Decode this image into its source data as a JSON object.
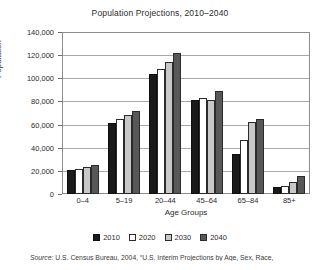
{
  "chart_data": {
    "type": "bar",
    "title": "Population Projections, 2010–2040",
    "xlabel": "Age Groups",
    "ylabel": "Population",
    "categories": [
      "0–4",
      "5–19",
      "20–44",
      "45–64",
      "65–84",
      "85+"
    ],
    "series": [
      {
        "name": "2010",
        "color": "#1a1a1a",
        "values": [
          21000,
          61000,
          104000,
          81000,
          35000,
          6000
        ]
      },
      {
        "name": "2020",
        "color": "#ffffff",
        "values": [
          22000,
          65000,
          108000,
          83000,
          47000,
          7000
        ]
      },
      {
        "name": "2030",
        "color": "#c8c8c8",
        "values": [
          23000,
          68000,
          114000,
          81000,
          62000,
          10000
        ]
      },
      {
        "name": "2040",
        "color": "#585858",
        "values": [
          25000,
          72000,
          122000,
          89000,
          65000,
          16000
        ]
      }
    ],
    "ylim": [
      0,
      140000
    ],
    "ytick_values": [
      0,
      20000,
      40000,
      60000,
      80000,
      100000,
      120000,
      140000
    ],
    "ytick_labels": [
      "0",
      "20,000",
      "40,000",
      "60,000",
      "80,000",
      "100,000",
      "120,000",
      "140,000"
    ],
    "grid": true,
    "legend_position": "bottom"
  },
  "source": {
    "lead": "Source:",
    "text": " U.S. Census Bureau, 2004, “U.S. Interim Projections by Age, Sex, Race,"
  }
}
